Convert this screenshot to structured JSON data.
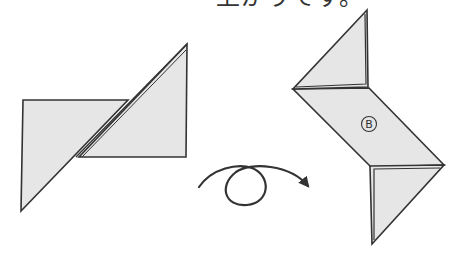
{
  "caption": {
    "text": "上がりです。"
  },
  "colors": {
    "paper_fill": "#e6e6e6",
    "stroke": "#333333",
    "background": "#ffffff"
  },
  "figures": {
    "before": {
      "description": "folded paper, two right triangles overlapping along a diagonal crease",
      "pieces": [
        {
          "name": "left-piece",
          "points": [
            [
              23,
              100
            ],
            [
              128,
              100
            ],
            [
              21,
              211
            ]
          ]
        },
        {
          "name": "right-piece",
          "points": [
            [
              187,
              44
            ],
            [
              186,
              157
            ],
            [
              79,
              157
            ]
          ]
        }
      ]
    },
    "turn_over_arrow": {
      "meaning": "flip over",
      "start": [
        199,
        187
      ],
      "end": [
        310,
        188
      ]
    },
    "after": {
      "description": "shuriken-like folded shape with labeled center panel",
      "label": "B",
      "pieces": [
        {
          "name": "top-triangle",
          "points": [
            [
              367,
              10
            ],
            [
              293,
              89
            ],
            [
              368,
              87
            ]
          ]
        },
        {
          "name": "center-parallelogram",
          "points": [
            [
              293,
              89
            ],
            [
              369,
              88
            ],
            [
              444,
              165
            ],
            [
              371,
              167
            ]
          ]
        },
        {
          "name": "bottom-triangle",
          "points": [
            [
              370,
              166
            ],
            [
              444,
              165
            ],
            [
              372,
              244
            ]
          ]
        }
      ]
    }
  }
}
